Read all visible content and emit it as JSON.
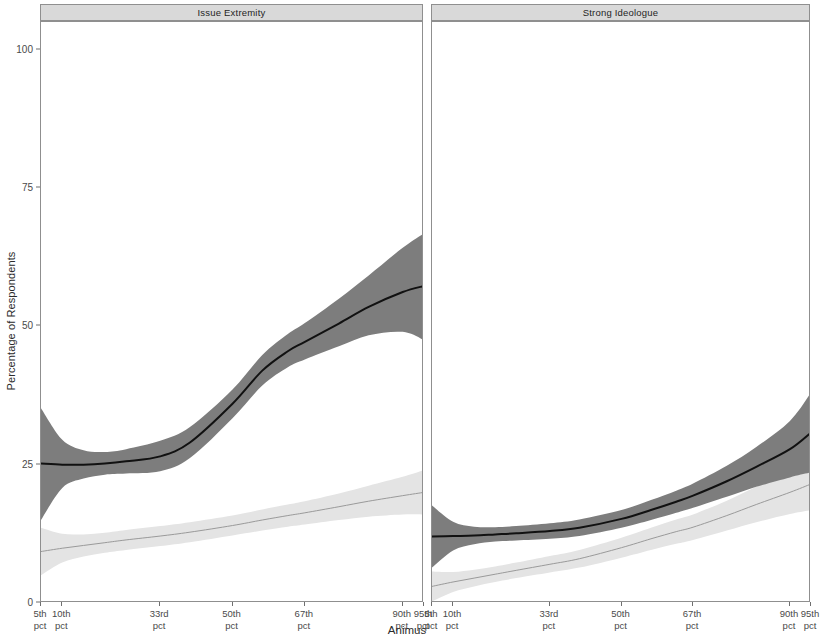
{
  "chart_data": {
    "type": "line",
    "title": "",
    "xlabel": "Animus",
    "ylabel": "Percentage of Respondents",
    "ylim": [
      0,
      105
    ],
    "yticks": [
      0,
      25,
      50,
      75,
      100
    ],
    "ytick_labels": [
      "0",
      "25",
      "50",
      "75",
      "100"
    ],
    "xtick_labels": [
      "5th\npct",
      "10th\npct",
      "33rd\npct",
      "50th\npct",
      "67th\npct",
      "90th\npct",
      "95th\npct"
    ],
    "xtick_values": [
      5,
      10,
      33,
      50,
      67,
      90,
      95
    ],
    "xlim": [
      5,
      95
    ],
    "grid": false,
    "legend": "none",
    "facets": [
      {
        "label": "Issue Extremity",
        "series": [
          {
            "name": "dark-estimate",
            "color": "#7d7d7d",
            "line_color": "#111111",
            "x": [
              5,
              10,
              15,
              20,
              25,
              33,
              40,
              50,
              57,
              63,
              67,
              75,
              82,
              90,
              95
            ],
            "y": [
              25.2,
              25.0,
              25.0,
              25.2,
              25.6,
              26.5,
              29.0,
              36.0,
              42.0,
              45.5,
              47.2,
              50.5,
              53.5,
              56.2,
              57.3
            ],
            "lower": [
              15.0,
              20.8,
              22.5,
              23.2,
              23.4,
              23.8,
              26.2,
              33.4,
              39.3,
              42.6,
              44.0,
              46.4,
              48.4,
              49.0,
              47.5
            ],
            "upper": [
              35.2,
              29.5,
              27.6,
              27.3,
              27.8,
              29.3,
              31.8,
              38.6,
              44.8,
              48.6,
              50.6,
              55.0,
              59.2,
              64.2,
              66.8
            ]
          },
          {
            "name": "light-estimate",
            "color": "#e4e4e4",
            "line_color": "#9a9a9a",
            "x": [
              5,
              10,
              15,
              20,
              25,
              33,
              40,
              50,
              57,
              63,
              67,
              75,
              82,
              90,
              95
            ],
            "y": [
              9.3,
              9.9,
              10.4,
              10.9,
              11.4,
              12.1,
              12.8,
              14.0,
              15.0,
              15.8,
              16.3,
              17.4,
              18.4,
              19.4,
              20.0
            ],
            "lower": [
              5.0,
              7.3,
              8.4,
              9.1,
              9.6,
              10.3,
              11.0,
              12.2,
              13.1,
              13.8,
              14.2,
              15.0,
              15.6,
              16.0,
              16.0
            ],
            "upper": [
              13.6,
              12.5,
              12.4,
              12.7,
              13.2,
              13.9,
              14.6,
              15.8,
              16.9,
              17.8,
              18.4,
              19.8,
              21.2,
              22.8,
              24.0
            ]
          }
        ]
      },
      {
        "label": "Strong Ideologue",
        "series": [
          {
            "name": "dark-estimate",
            "color": "#7d7d7d",
            "line_color": "#111111",
            "x": [
              5,
              10,
              15,
              20,
              25,
              33,
              40,
              50,
              57,
              63,
              67,
              75,
              82,
              90,
              95
            ],
            "y": [
              12.0,
              12.1,
              12.2,
              12.4,
              12.6,
              13.0,
              13.6,
              15.2,
              16.8,
              18.3,
              19.4,
              22.0,
              24.6,
              27.8,
              30.8
            ],
            "lower": [
              6.4,
              9.5,
              10.6,
              11.1,
              11.3,
              11.6,
              12.1,
              13.6,
              15.0,
              16.3,
              17.2,
              19.2,
              21.0,
              22.7,
              23.6
            ],
            "upper": [
              17.6,
              14.7,
              13.8,
              13.7,
              13.9,
              14.4,
              15.1,
              16.8,
              18.6,
              20.3,
              21.6,
              24.8,
              28.2,
              32.9,
              38.0
            ]
          },
          {
            "name": "light-estimate",
            "color": "#e4e4e4",
            "line_color": "#9a9a9a",
            "x": [
              5,
              10,
              15,
              20,
              25,
              33,
              40,
              50,
              57,
              63,
              67,
              75,
              82,
              90,
              95
            ],
            "y": [
              3.0,
              3.8,
              4.5,
              5.2,
              5.9,
              7.0,
              8.0,
              10.0,
              11.6,
              12.9,
              13.7,
              15.8,
              17.8,
              20.0,
              21.5
            ],
            "lower": [
              0.3,
              2.0,
              3.0,
              3.8,
              4.5,
              5.5,
              6.4,
              8.2,
              9.6,
              10.7,
              11.4,
              13.1,
              14.6,
              16.1,
              16.8
            ],
            "upper": [
              5.7,
              5.6,
              6.0,
              6.6,
              7.3,
              8.5,
              9.6,
              11.8,
              13.6,
              15.1,
              16.0,
              18.5,
              21.0,
              23.9,
              26.2
            ]
          }
        ]
      }
    ]
  },
  "colors": {
    "dark_ribbon": "#7d7d7d",
    "light_ribbon": "#e4e4e4",
    "dark_line": "#111111",
    "light_line": "#9a9a9a",
    "strip_fill": "#d9d9d9",
    "panel_border": "#8f8f8f",
    "axis_text": "#4a4a4a"
  }
}
